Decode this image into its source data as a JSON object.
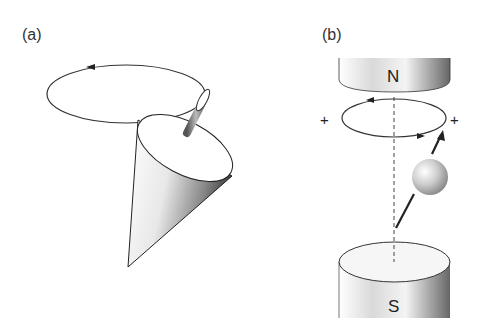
{
  "panels": [
    {
      "id": "a",
      "label": "(a)",
      "description": "Precessing spinning top (cone) with rod tracing a circular path with direction arrows"
    },
    {
      "id": "b",
      "label": "(b)",
      "description": "Magnetic moment precessing between N and S magnet poles around dashed field axis"
    }
  ],
  "magnets": {
    "north": "N",
    "south": "S"
  },
  "markers": {
    "plus_left": "+",
    "plus_right": "+"
  }
}
